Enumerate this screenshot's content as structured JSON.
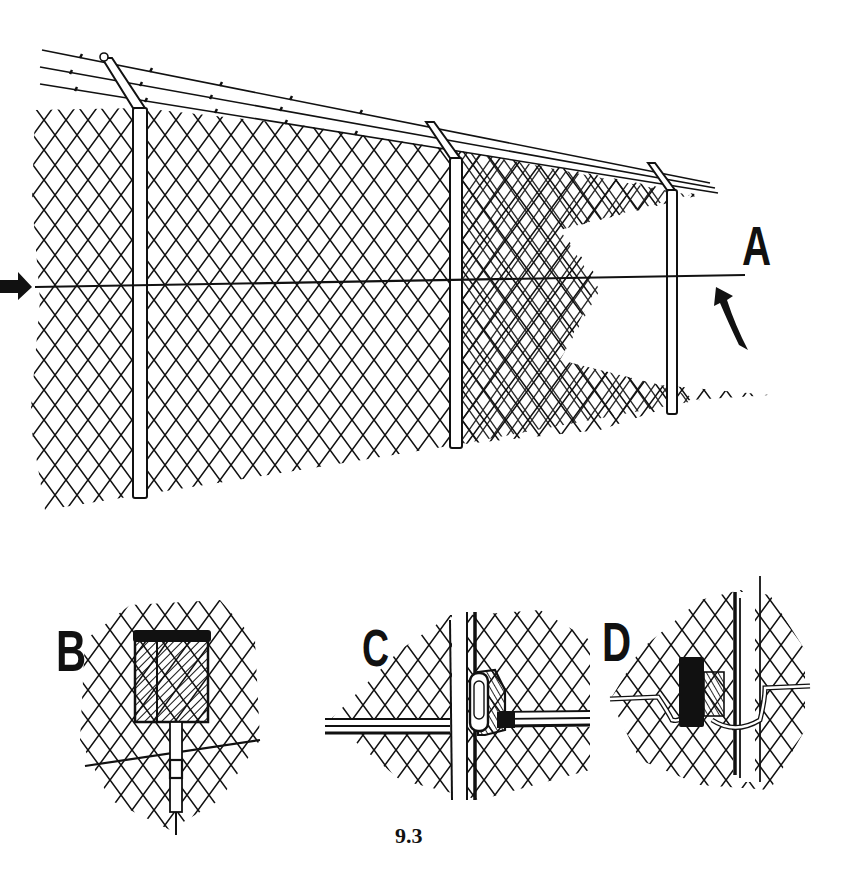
{
  "figure": {
    "number": "9.3",
    "panels": [
      {
        "id": "A",
        "label": "A",
        "description": "Chain-link perimeter fence with barbed-wire outriggers and a sensor cable running horizontally along mid-height of the fabric"
      },
      {
        "id": "B",
        "label": "B",
        "description": "Sensor processor box mounted on the fence fabric with cable entering from below"
      },
      {
        "id": "C",
        "label": "C",
        "description": "Cable clamp attaching sensor cable to a fence post"
      },
      {
        "id": "D",
        "label": "D",
        "description": "Cable loop routed around a fence post via a junction block"
      }
    ],
    "arrows": [
      {
        "id": "left-arrow",
        "points_to": "sensor cable"
      },
      {
        "id": "a-arrow",
        "points_to": "sensor cable"
      }
    ]
  },
  "colors": {
    "ink": "#111111",
    "paper": "#ffffff"
  }
}
